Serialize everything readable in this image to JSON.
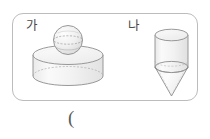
{
  "page": {
    "width": 210,
    "height": 139,
    "background_color": "#ffffff"
  },
  "figure_box": {
    "border_color": "#bcbcbc",
    "corner_radius": 11
  },
  "shapes": [
    {
      "label": "가",
      "description": "sphere resting on a short wide cylinder",
      "components": [
        "sphere",
        "cylinder"
      ],
      "stroke_color": "#8a8a8a",
      "fill_color": "#f4f4f4"
    },
    {
      "label": "나",
      "description": "cylinder with an inverted cone attached below",
      "components": [
        "cylinder",
        "cone"
      ],
      "stroke_color": "#8a8a8a",
      "fill_color": "#f4f4f4"
    }
  ],
  "answer": {
    "text": "(",
    "color": "#5a5a5a"
  }
}
